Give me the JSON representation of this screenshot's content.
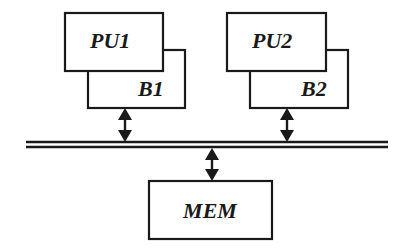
{
  "diagram": {
    "nodes": [
      {
        "id": "PU1",
        "label": "PU1"
      },
      {
        "id": "B1",
        "label": "B1"
      },
      {
        "id": "PU2",
        "label": "PU2"
      },
      {
        "id": "B2",
        "label": "B2"
      },
      {
        "id": "MEM",
        "label": "MEM"
      }
    ],
    "edges": [
      {
        "from": "B1",
        "to": "bus",
        "type": "bidirectional"
      },
      {
        "from": "B2",
        "to": "bus",
        "type": "bidirectional"
      },
      {
        "from": "bus",
        "to": "MEM",
        "type": "bidirectional"
      }
    ],
    "bus": {
      "style": "double-line"
    }
  }
}
